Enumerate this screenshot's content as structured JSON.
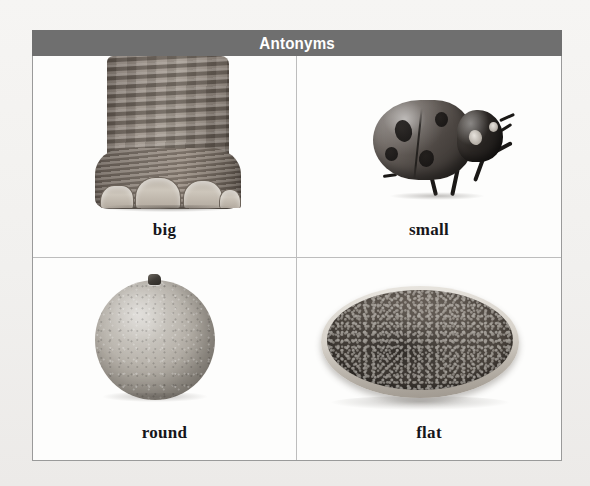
{
  "worksheet": {
    "title": "Antonyms",
    "title_bar_color": "#6f6f6f",
    "title_text_color": "#ffffff",
    "border_color": "#9a9a9a",
    "divider_color": "#bdbdbd",
    "page_background": "#f2f1ef",
    "cell_background": "#fdfdfc"
  },
  "cells": [
    {
      "id": "cell-big",
      "caption": "big",
      "image": "elephant-foot-photo"
    },
    {
      "id": "cell-small",
      "caption": "small",
      "image": "ladybug-photo"
    },
    {
      "id": "cell-round",
      "caption": "round",
      "image": "orange-fruit-photo"
    },
    {
      "id": "cell-flat",
      "caption": "flat",
      "image": "flat-pancake-photo"
    }
  ],
  "pairs": [
    {
      "left": "big",
      "right": "small"
    },
    {
      "left": "round",
      "right": "flat"
    }
  ]
}
